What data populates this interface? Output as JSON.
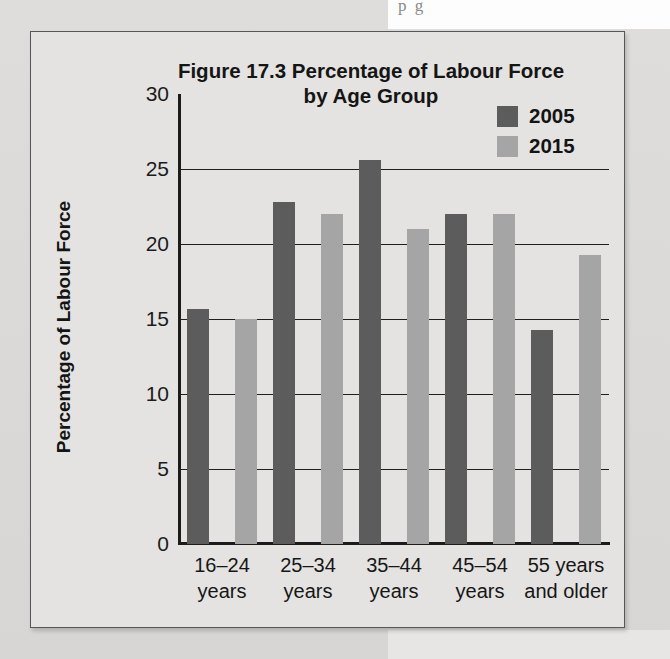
{
  "page": {
    "background_color": "#d9d9d7",
    "bleed_text": "p                                        g"
  },
  "figure": {
    "border_color": "#55565a",
    "background_color": "#e4e3e1"
  },
  "chart_data": {
    "type": "bar",
    "title": "Figure 17.3 Percentage of Labour Force by Age Group",
    "title_line1": "Figure 17.3 Percentage of Labour Force",
    "title_line2": "by Age Group",
    "xlabel": "",
    "ylabel": "Percentage of Labour Force",
    "ylim": [
      0,
      30
    ],
    "yticks": [
      0,
      5,
      10,
      15,
      20,
      25,
      30
    ],
    "ytick_labels": [
      "0",
      "5",
      "10",
      "15",
      "20",
      "25",
      "30"
    ],
    "grid": true,
    "legend_position": "top-right",
    "categories": [
      "16–24\nyears",
      "25–34\nyears",
      "35–44\nyears",
      "45–54\nyears",
      "55 years\nand older"
    ],
    "series": [
      {
        "name": "2005",
        "color": "#5c5c5c",
        "values": [
          15.7,
          22.8,
          25.6,
          22.0,
          14.3
        ]
      },
      {
        "name": "2015",
        "color": "#a5a5a5",
        "values": [
          15.0,
          22.0,
          21.0,
          22.0,
          19.3
        ]
      }
    ]
  }
}
